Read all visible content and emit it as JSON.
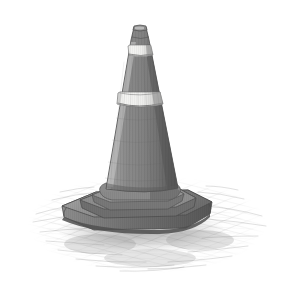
{
  "artwork": {
    "title": "Traffic Cone",
    "medium": "Graphite pencil sketch",
    "subject": "traffic-cone",
    "caption": "Pencil drawing of a striped traffic cone on a hatched ground",
    "canvas": {
      "width": 290,
      "height": 301,
      "background": "#ffffff"
    },
    "palette": {
      "background": "#ffffff",
      "cone_body_light": "#a6a6a6",
      "cone_body_mid": "#8b8b8b",
      "cone_body_dark": "#6b6b6b",
      "cone_body_darkest": "#545454",
      "stripe_white": "#f2f2f0",
      "stripe_white_shade": "#d8d8d6",
      "base_light": "#9b9b9b",
      "base_mid": "#7e7e7e",
      "base_dark": "#5e5e5e",
      "outline": "#4a4a4a",
      "ground_hatch": "#9a9a9a",
      "shadow": "#8f8f8f"
    },
    "parts": [
      {
        "name": "cone-tip",
        "label": "Cone tip",
        "y_top": 26,
        "y_bottom": 44
      },
      {
        "name": "upper-stripe",
        "label": "Upper reflective stripe",
        "y_top": 45,
        "y_bottom": 56
      },
      {
        "name": "cone-midsection",
        "label": "Cone mid section",
        "y_top": 56,
        "y_bottom": 92
      },
      {
        "name": "lower-stripe",
        "label": "Lower reflective stripe",
        "y_top": 92,
        "y_bottom": 105
      },
      {
        "name": "cone-lower-body",
        "label": "Cone lower body",
        "y_top": 105,
        "y_bottom": 192
      },
      {
        "name": "cone-base",
        "label": "Stepped square base",
        "y_top": 190,
        "y_bottom": 232
      },
      {
        "name": "ground-hatching",
        "label": "Ground hatching and shadow",
        "y_top": 185,
        "y_bottom": 272
      }
    ],
    "geometry": {
      "tip_center_x": 140,
      "tip_width": 12,
      "shaft_left_at_base": 100,
      "shaft_right_at_base": 178,
      "base_left": 62,
      "base_right": 212,
      "base_top": 190,
      "base_bottom": 232,
      "ground_left": 28,
      "ground_right": 266,
      "ground_top": 186,
      "ground_bottom": 272
    }
  }
}
